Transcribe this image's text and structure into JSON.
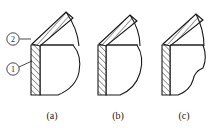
{
  "figure": {
    "background_color": "#ffffff",
    "line_color": "#1a1a1a",
    "width": 214,
    "height": 128,
    "callouts": [
      {
        "id": "callout-2",
        "label": "②",
        "plain_number": "2",
        "description": "Angled hatched strip (upper inclined member)",
        "circle_center_x": 13,
        "circle_center_y": 39,
        "leader_end_x": 31,
        "leader_end_y": 39
      },
      {
        "id": "callout-1",
        "label": "①",
        "plain_number": "1",
        "description": "Vertical diagonally hatched bar (left wall)",
        "circle_center_x": 13,
        "circle_center_y": 69,
        "leader_end_x": 32,
        "leader_end_y": 61
      }
    ],
    "panels": [
      {
        "id": "panel-a",
        "caption": "(a)",
        "caption_x": 52,
        "caption_y": 119,
        "profile_description": "Smooth broad bulging curve on right side",
        "origin_x": 0
      },
      {
        "id": "panel-b",
        "caption": "(b)",
        "caption_x": 118,
        "caption_y": 119,
        "profile_description": "Narrow pointed lens-shaped curve on right side",
        "origin_x": 66
      },
      {
        "id": "panel-c",
        "caption": "(c)",
        "caption_x": 184,
        "caption_y": 119,
        "profile_description": "Irregular wavy curve with inward notch on right side",
        "origin_x": 132
      }
    ]
  }
}
